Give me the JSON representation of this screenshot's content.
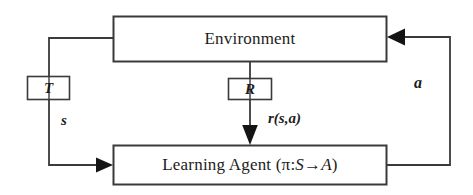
{
  "diagram": {
    "type": "block-diagram",
    "colors": {
      "stroke": "#3a3a3a",
      "text": "#1c1c1c",
      "background": "#ffffff",
      "arrowhead": "#141414"
    },
    "nodes": {
      "environment": {
        "label": "Environment",
        "shape": "rectangle",
        "x": 113,
        "y": 16,
        "width": 274,
        "height": 46
      },
      "agent": {
        "label": "Learning Agent (π: S→A)",
        "label_prefix": "Learning Agent (",
        "label_pi": "π",
        "label_colon": ": ",
        "label_state": "S",
        "label_arrow": "→",
        "label_action": "A",
        "label_suffix": ")",
        "shape": "rectangle",
        "x": 113,
        "y": 145,
        "width": 274,
        "height": 40
      },
      "transition": {
        "label": "T",
        "shape": "rectangle",
        "x": 27,
        "y": 76,
        "width": 43,
        "height": 24
      },
      "reward": {
        "label": "R",
        "shape": "rectangle",
        "x": 228,
        "y": 78,
        "width": 44,
        "height": 22
      }
    },
    "edge_labels": {
      "state": "s",
      "action": "a",
      "reward_signal": "r(s,a)"
    },
    "edges": [
      {
        "name": "environment-to-transition",
        "from": "environment",
        "to": "transition",
        "direction": "down"
      },
      {
        "name": "transition-to-agent",
        "from": "transition",
        "to": "agent",
        "direction": "right",
        "label": "s"
      },
      {
        "name": "environment-to-reward",
        "from": "environment",
        "to": "reward",
        "direction": "down"
      },
      {
        "name": "reward-to-agent",
        "from": "reward",
        "to": "agent",
        "direction": "down",
        "label": "r(s,a)"
      },
      {
        "name": "agent-to-environment",
        "from": "agent",
        "to": "environment",
        "direction": "up",
        "label": "a"
      }
    ]
  }
}
